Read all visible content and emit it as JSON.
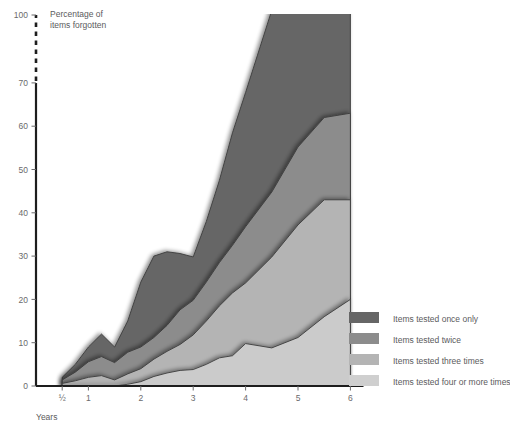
{
  "chart_data": {
    "type": "area",
    "stacked": true,
    "title": "",
    "ylabel": "Percentage of items forgotten",
    "xlabel": "Years",
    "ylim": [
      0,
      100
    ],
    "xlim": [
      0,
      6.25
    ],
    "grid": false,
    "axis_break": {
      "from": 70,
      "to": 100,
      "style": "dashed"
    },
    "ytick_labels": [
      "0",
      "10",
      "20",
      "30",
      "40",
      "50",
      "60",
      "70",
      "100"
    ],
    "ytick_values": [
      0,
      10,
      20,
      30,
      40,
      50,
      60,
      70,
      100
    ],
    "xtick_labels": [
      "½",
      "1",
      "2",
      "3",
      "4",
      "5",
      "6"
    ],
    "xtick_values": [
      0.5,
      1,
      2,
      3,
      4,
      5,
      6
    ],
    "legend_position": "right",
    "x": [
      0.5,
      0.75,
      1.0,
      1.25,
      1.5,
      1.75,
      2.0,
      2.25,
      2.5,
      2.75,
      3.0,
      3.25,
      3.5,
      3.75,
      4.0,
      4.5,
      5.0,
      5.5,
      6.0
    ],
    "series": [
      {
        "name": "Items tested four or more times",
        "color": "#cbcbcb",
        "values": [
          0.0,
          0.0,
          0.0,
          0.0,
          0.0,
          0.4,
          1.0,
          2.2,
          3.0,
          3.6,
          3.8,
          5.0,
          6.5,
          7.0,
          9.8,
          8.8,
          11.2,
          16.0,
          20.0
        ]
      },
      {
        "name": "Items tested three times",
        "color": "#b4b4b4",
        "values": [
          0.6,
          1.2,
          2.0,
          2.4,
          1.4,
          2.4,
          3.0,
          4.0,
          5.0,
          6.0,
          8.0,
          10.0,
          12.0,
          14.5,
          14.0,
          21.0,
          26.0,
          27.0,
          23.0
        ]
      },
      {
        "name": "Items tested twice",
        "color": "#8c8c8c",
        "values": [
          0.8,
          2.0,
          3.6,
          4.4,
          4.0,
          5.0,
          5.0,
          5.0,
          6.0,
          8.0,
          8.0,
          9.0,
          10.0,
          11.0,
          13.0,
          15.0,
          18.0,
          19.0,
          20.0
        ]
      },
      {
        "name": "Items tested once only",
        "color": "#666666",
        "values": [
          0.6,
          1.8,
          3.4,
          5.2,
          3.6,
          7.2,
          15.0,
          18.8,
          17.0,
          13.0,
          10.0,
          14.0,
          19.0,
          26.0,
          31.0,
          42.0,
          45.0,
          38.0,
          37.0
        ]
      }
    ]
  },
  "axis": {
    "y_caption_line1": "Percentage of",
    "y_caption_line2": "items forgotten",
    "x_caption": "Years"
  },
  "legend": {
    "items": [
      {
        "label": "Items tested once only",
        "color": "#666666"
      },
      {
        "label": "Items tested twice",
        "color": "#8c8c8c"
      },
      {
        "label": "Items tested three times",
        "color": "#b4b4b4"
      },
      {
        "label": "Items tested four or more times",
        "color": "#cfcfcf"
      }
    ]
  }
}
